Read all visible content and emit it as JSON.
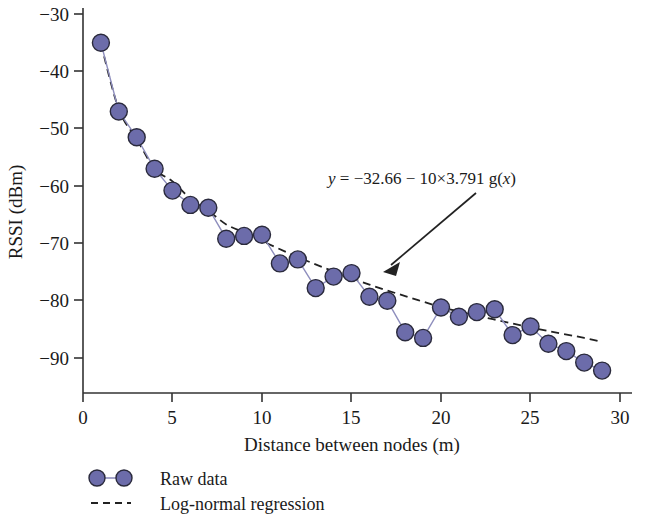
{
  "chart_data": {
    "type": "scatter",
    "title": "",
    "xlabel": "Distance between nodes (m)",
    "ylabel": "RSSI (dBm)",
    "xlim": [
      0,
      30
    ],
    "ylim": [
      -95,
      -28
    ],
    "xticks": [
      0,
      5,
      10,
      15,
      20,
      25,
      30
    ],
    "yticks": [
      -30,
      -40,
      -50,
      -60,
      -70,
      -80,
      -90
    ],
    "xtick_labels": [
      "0",
      "5",
      "10",
      "15",
      "20",
      "25",
      "30"
    ],
    "ytick_labels": [
      "−30",
      "−40",
      "−50",
      "−60",
      "−70",
      "−80",
      "−90"
    ],
    "grid": false,
    "legend_position": "below-axes",
    "annotation": "y = −32.66 − 10×3.791 g(x)",
    "annotation_parts": {
      "y": "y",
      "eq": " = −32.66 − 10×3.791 g(",
      "x": "x",
      "close": ")"
    },
    "series": [
      {
        "name": "Raw data",
        "style": "markers-with-line",
        "color": "#6c6caa",
        "line_color": "#8e8ebd",
        "x": [
          1,
          2,
          3,
          4,
          5,
          6,
          7,
          8,
          9,
          10,
          11,
          12,
          13,
          14,
          15,
          16,
          17,
          18,
          19,
          20,
          21,
          22,
          23,
          24,
          25,
          26,
          27,
          28,
          29
        ],
        "y": [
          -35.0,
          -47.0,
          -51.5,
          -57.0,
          -60.8,
          -63.3,
          -63.8,
          -69.2,
          -68.7,
          -68.5,
          -73.5,
          -72.8,
          -77.8,
          -75.8,
          -75.2,
          -79.3,
          -80.0,
          -85.5,
          -86.5,
          -81.2,
          -82.8,
          -82.0,
          -81.5,
          -86.0,
          -84.5,
          -87.5,
          -88.8,
          -90.8,
          -92.2
        ]
      },
      {
        "name": "Log-normal regression",
        "style": "dashed-line",
        "color": "#222222",
        "model": "y = -32.66 - 10*3.791*log10(x)",
        "intercept": -32.66,
        "path_loss_exponent": 3.791,
        "x": [
          1,
          2,
          3,
          4,
          5,
          6,
          7,
          8,
          9,
          10,
          12,
          14,
          16,
          18,
          20,
          22,
          24,
          26,
          28,
          29
        ],
        "y": [
          -35.2,
          -46.6,
          -51.8,
          -57.0,
          -59.2,
          -62.2,
          -64.3,
          -66.7,
          -68.1,
          -69.6,
          -72.4,
          -74.9,
          -77.2,
          -79.2,
          -81.1,
          -82.6,
          -84.0,
          -85.3,
          -86.5,
          -87.2
        ]
      }
    ],
    "legend": [
      {
        "label": "Raw data",
        "marker": "circle-with-line",
        "color": "#6c6caa"
      },
      {
        "label": "Log-normal regression",
        "marker": "dashed-line",
        "color": "#222222"
      }
    ]
  }
}
